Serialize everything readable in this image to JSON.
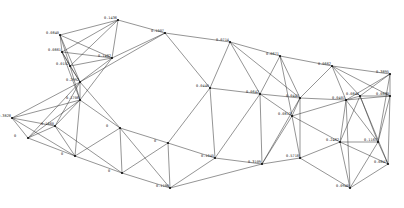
{
  "diagram": {
    "type": "3d-space-truss-wireframe",
    "stroke_color": "#2a2a2a",
    "background": "#ffffff",
    "nodes": [
      {
        "id": "A1",
        "x": 118,
        "y": 20,
        "label": "0.1436"
      },
      {
        "id": "A2",
        "x": 60,
        "y": 35,
        "label": "0.0840"
      },
      {
        "id": "A3",
        "x": 165,
        "y": 33,
        "label": "0.1007"
      },
      {
        "id": "A4",
        "x": 112,
        "y": 58,
        "label": "0.1482"
      },
      {
        "id": "A5",
        "x": 62,
        "y": 52,
        "label": "0.0861"
      },
      {
        "id": "A6",
        "x": 70,
        "y": 66,
        "label": "0.0152"
      },
      {
        "id": "A7",
        "x": 80,
        "y": 82,
        "label": "0.2992"
      },
      {
        "id": "A8",
        "x": 80,
        "y": 100,
        "label": "0.1706"
      },
      {
        "id": "A9",
        "x": 12,
        "y": 118,
        "label": "0.3828"
      },
      {
        "id": "A10",
        "x": 55,
        "y": 126,
        "label": "0.1660"
      },
      {
        "id": "B1",
        "x": 230,
        "y": 42,
        "label": "0.0714"
      },
      {
        "id": "B2",
        "x": 280,
        "y": 56,
        "label": "0.0671"
      },
      {
        "id": "B3",
        "x": 332,
        "y": 66,
        "label": "0.0662"
      },
      {
        "id": "B4",
        "x": 390,
        "y": 74,
        "label": "0.3895"
      },
      {
        "id": "B5",
        "x": 360,
        "y": 96,
        "label": "0.0844"
      },
      {
        "id": "B6",
        "x": 390,
        "y": 96,
        "label": "0.0880"
      },
      {
        "id": "C1",
        "x": 210,
        "y": 88,
        "label": "0.0440"
      },
      {
        "id": "C2",
        "x": 260,
        "y": 94,
        "label": "0.0642"
      },
      {
        "id": "C3",
        "x": 300,
        "y": 98,
        "label": "0.0447"
      },
      {
        "id": "C4",
        "x": 346,
        "y": 100,
        "label": "0.0401"
      },
      {
        "id": "D1",
        "x": 292,
        "y": 116,
        "label": "0.0812"
      },
      {
        "id": "D2",
        "x": 340,
        "y": 142,
        "label": "0.2462"
      },
      {
        "id": "D3",
        "x": 378,
        "y": 142,
        "label": "0.1167"
      },
      {
        "id": "D4",
        "x": 300,
        "y": 158,
        "label": "0.5718"
      },
      {
        "id": "D5",
        "x": 388,
        "y": 164,
        "label": "0.0847"
      },
      {
        "id": "E1",
        "x": 28,
        "y": 138,
        "label": "0"
      },
      {
        "id": "E2",
        "x": 75,
        "y": 156,
        "label": "0"
      },
      {
        "id": "E3",
        "x": 122,
        "y": 173,
        "label": "0"
      },
      {
        "id": "E4",
        "x": 170,
        "y": 188,
        "label": "0.1190"
      },
      {
        "id": "E5",
        "x": 120,
        "y": 128,
        "label": "0"
      },
      {
        "id": "E6",
        "x": 168,
        "y": 143,
        "label": "0"
      },
      {
        "id": "E7",
        "x": 215,
        "y": 158,
        "label": "0.1045"
      },
      {
        "id": "F1",
        "x": 350,
        "y": 188,
        "label": "0.0940"
      },
      {
        "id": "F2",
        "x": 262,
        "y": 164,
        "label": "0.3109"
      }
    ]
  }
}
